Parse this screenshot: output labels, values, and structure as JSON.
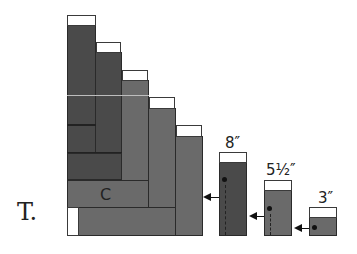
{
  "figure": {
    "label": "T.",
    "block_label": "C",
    "containers": [
      {
        "label": "8″"
      },
      {
        "label": "5½″"
      },
      {
        "label": "3″"
      }
    ]
  },
  "colors": {
    "dark_fill": "#4a4a4a",
    "mid_fill": "#6a6a6a",
    "cap": "#ffffff",
    "outline": "#2a2a2a"
  }
}
